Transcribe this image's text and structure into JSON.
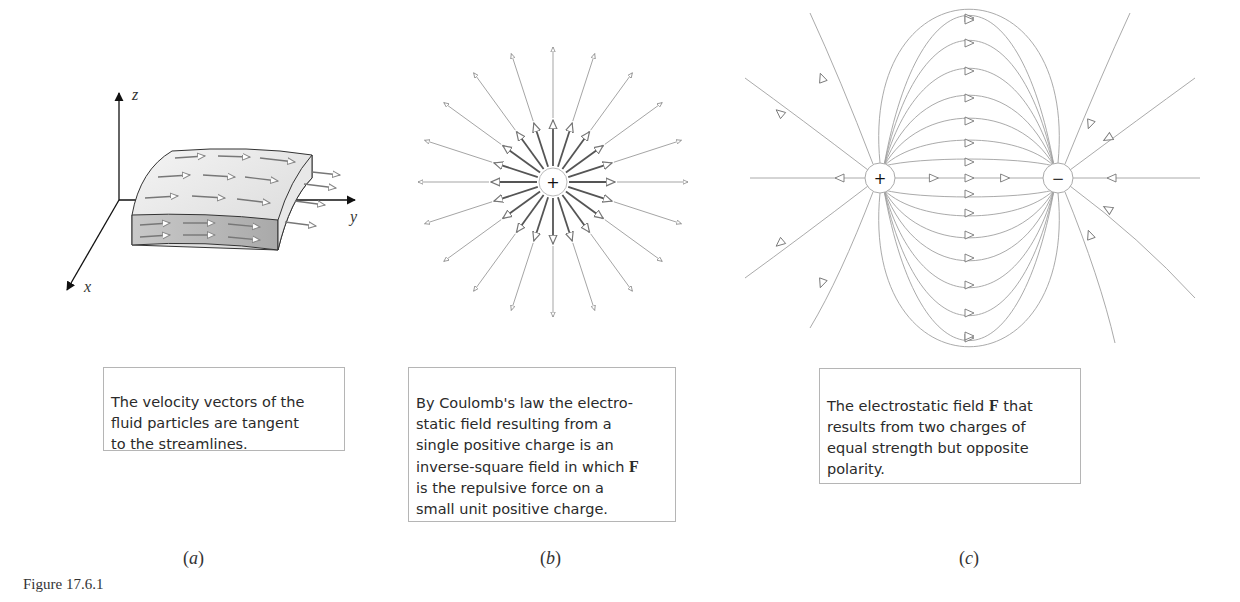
{
  "figure": {
    "label": "Figure 17.6.1",
    "panels": [
      {
        "id": "a",
        "sublabel": "a",
        "axes": {
          "x": "x",
          "y": "y",
          "z": "z"
        },
        "caption": "The velocity vectors of the\nfluid particles are tangent\nto the streamlines."
      },
      {
        "id": "b",
        "sublabel": "b",
        "charge_symbol": "+",
        "caption_parts": [
          "By Coulomb's law the electro-\nstatic field resulting from a\nsingle positive charge is an\ninverse-square field in which ",
          "F",
          "\nis the repulsive force on a\nsmall unit positive charge."
        ]
      },
      {
        "id": "c",
        "sublabel": "c",
        "positive_symbol": "+",
        "negative_symbol": "−",
        "caption_parts": [
          "The electrostatic field ",
          "F",
          " that\nresults from two charges of\nequal strength but opposite\npolarity."
        ]
      }
    ]
  },
  "colors": {
    "line": "#9a9a9a",
    "dark_line": "#555555",
    "slab_top": "#e6e6e6",
    "slab_side": "#bdbdbd",
    "border": "#b5b5b5"
  }
}
